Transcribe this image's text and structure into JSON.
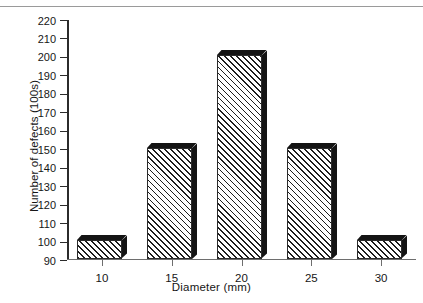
{
  "chart_data": {
    "type": "bar",
    "title": "",
    "xlabel": "Diameter (mm)",
    "ylabel": "Number of defects (100s)",
    "categories": [
      "10",
      "15",
      "20",
      "25",
      "30"
    ],
    "values": [
      100,
      150,
      200,
      150,
      100
    ],
    "ylim": [
      90,
      220
    ],
    "ytick_step": 10,
    "yticks": [
      220,
      210,
      200,
      190,
      180,
      170,
      160,
      150,
      140,
      130,
      120,
      110,
      100,
      90
    ],
    "grid": false,
    "legend": null,
    "series": [
      {
        "name": "Number of defects",
        "values": [
          100,
          150,
          200,
          150,
          100
        ]
      }
    ],
    "style": {
      "bar_fill": "#ffffff",
      "bar_hatch": "diagonal-45",
      "bar_hatch_color": "#1d1d1d",
      "bar_edge": "#2b2b2b",
      "bar_shadow": "#141414",
      "axis_color": "#2b2b2b",
      "background": "#ffffff"
    }
  }
}
